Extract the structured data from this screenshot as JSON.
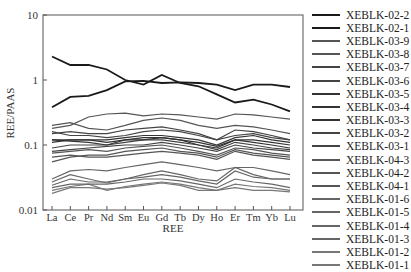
{
  "chart_data": {
    "type": "line",
    "title": "",
    "xlabel": "REE",
    "ylabel": "REE/PAAS",
    "yscale": "log",
    "ylim": [
      0.01,
      10
    ],
    "yticks": [
      "0.01",
      "0.1",
      "1",
      "10"
    ],
    "grid": false,
    "legend_position": "right",
    "categories": [
      "La",
      "Ce",
      "Pr",
      "Nd",
      "Sm",
      "Eu",
      "Gd",
      "Tb",
      "Dy",
      "Ho",
      "Er",
      "Tm",
      "Yb",
      "Lu"
    ],
    "series": [
      {
        "name": "XEBLK-02-2",
        "color": "#1a1a1a",
        "width": 1.8,
        "values": [
          2.3,
          1.7,
          1.7,
          1.45,
          1.0,
          0.85,
          1.2,
          0.9,
          0.8,
          0.6,
          0.45,
          0.5,
          0.42,
          0.33
        ]
      },
      {
        "name": "XEBLK-02-1",
        "color": "#1a1a1a",
        "width": 1.8,
        "values": [
          0.38,
          0.55,
          0.57,
          0.7,
          0.95,
          0.97,
          0.9,
          0.92,
          0.9,
          0.85,
          0.7,
          0.85,
          0.85,
          0.78
        ]
      },
      {
        "name": "XEBLK-03-9",
        "color": "#555",
        "width": 1.2,
        "values": [
          0.18,
          0.2,
          0.27,
          0.3,
          0.31,
          0.28,
          0.3,
          0.29,
          0.27,
          0.25,
          0.3,
          0.29,
          0.27,
          0.25
        ]
      },
      {
        "name": "XEBLK-03-8",
        "color": "#555",
        "width": 1.2,
        "values": [
          0.2,
          0.22,
          0.18,
          0.17,
          0.2,
          0.24,
          0.26,
          0.24,
          0.2,
          0.18,
          0.2,
          0.19,
          0.17,
          0.15
        ]
      },
      {
        "name": "XEBLK-03-7",
        "color": "#444",
        "width": 1.2,
        "values": [
          0.15,
          0.16,
          0.15,
          0.15,
          0.17,
          0.18,
          0.19,
          0.17,
          0.15,
          0.12,
          0.17,
          0.16,
          0.14,
          0.12
        ]
      },
      {
        "name": "XEBLK-03-6",
        "color": "#444",
        "width": 1.2,
        "values": [
          0.16,
          0.14,
          0.14,
          0.13,
          0.14,
          0.16,
          0.17,
          0.16,
          0.14,
          0.12,
          0.14,
          0.15,
          0.13,
          0.12
        ]
      },
      {
        "name": "XEBLK-03-5",
        "color": "#333",
        "width": 1.2,
        "values": [
          0.12,
          0.12,
          0.12,
          0.12,
          0.13,
          0.14,
          0.14,
          0.13,
          0.12,
          0.1,
          0.13,
          0.14,
          0.12,
          0.11
        ]
      },
      {
        "name": "XEBLK-03-4",
        "color": "#333",
        "width": 1.2,
        "values": [
          0.12,
          0.115,
          0.11,
          0.1,
          0.12,
          0.13,
          0.13,
          0.12,
          0.11,
          0.095,
          0.12,
          0.12,
          0.11,
          0.1
        ]
      },
      {
        "name": "XEBLK-03-3",
        "color": "#333",
        "width": 1.2,
        "values": [
          0.11,
          0.12,
          0.12,
          0.11,
          0.12,
          0.12,
          0.13,
          0.12,
          0.1,
          0.09,
          0.12,
          0.11,
          0.1,
          0.09
        ]
      },
      {
        "name": "XEBLK-03-2",
        "color": "#444",
        "width": 1.2,
        "values": [
          0.09,
          0.1,
          0.1,
          0.1,
          0.11,
          0.12,
          0.12,
          0.11,
          0.1,
          0.085,
          0.11,
          0.1,
          0.09,
          0.085
        ]
      },
      {
        "name": "XEBLK-03-1",
        "color": "#444",
        "width": 1.2,
        "values": [
          0.08,
          0.085,
          0.09,
          0.095,
          0.1,
          0.1,
          0.11,
          0.1,
          0.09,
          0.08,
          0.1,
          0.09,
          0.085,
          0.08
        ]
      },
      {
        "name": "XEBLK-04-3",
        "color": "#555",
        "width": 1.2,
        "values": [
          0.075,
          0.08,
          0.085,
          0.08,
          0.09,
          0.095,
          0.1,
          0.09,
          0.08,
          0.07,
          0.09,
          0.085,
          0.075,
          0.07
        ]
      },
      {
        "name": "XEBLK-04-2",
        "color": "#555",
        "width": 1.2,
        "values": [
          0.065,
          0.07,
          0.065,
          0.065,
          0.07,
          0.075,
          0.08,
          0.075,
          0.07,
          0.06,
          0.08,
          0.07,
          0.065,
          0.06
        ]
      },
      {
        "name": "XEBLK-04-1",
        "color": "#555",
        "width": 1.2,
        "values": [
          0.055,
          0.065,
          0.07,
          0.07,
          0.08,
          0.085,
          0.09,
          0.08,
          0.075,
          0.065,
          0.085,
          0.075,
          0.07,
          0.065
        ]
      },
      {
        "name": "XEBLK-01-6",
        "color": "#666",
        "width": 1.2,
        "values": [
          0.03,
          0.04,
          0.042,
          0.04,
          0.045,
          0.05,
          0.055,
          0.05,
          0.045,
          0.04,
          0.045,
          0.045,
          0.04,
          0.035
        ]
      },
      {
        "name": "XEBLK-01-5",
        "color": "#666",
        "width": 1.2,
        "values": [
          0.027,
          0.035,
          0.03,
          0.026,
          0.03,
          0.035,
          0.04,
          0.035,
          0.03,
          0.028,
          0.045,
          0.035,
          0.03,
          0.03
        ]
      },
      {
        "name": "XEBLK-01-4",
        "color": "#666",
        "width": 1.2,
        "values": [
          0.024,
          0.03,
          0.027,
          0.027,
          0.03,
          0.032,
          0.035,
          0.032,
          0.028,
          0.025,
          0.04,
          0.032,
          0.03,
          0.03
        ]
      },
      {
        "name": "XEBLK-01-3",
        "color": "#666",
        "width": 1.2,
        "values": [
          0.022,
          0.025,
          0.025,
          0.025,
          0.027,
          0.03,
          0.03,
          0.028,
          0.025,
          0.022,
          0.03,
          0.027,
          0.025,
          0.022
        ]
      },
      {
        "name": "XEBLK-01-2",
        "color": "#777",
        "width": 1.2,
        "values": [
          0.02,
          0.023,
          0.025,
          0.02,
          0.023,
          0.025,
          0.027,
          0.025,
          0.022,
          0.02,
          0.025,
          0.023,
          0.022,
          0.02
        ]
      },
      {
        "name": "XEBLK-01-1",
        "color": "#777",
        "width": 1.2,
        "values": [
          0.018,
          0.022,
          0.022,
          0.021,
          0.022,
          0.024,
          0.026,
          0.024,
          0.02,
          0.02,
          0.022,
          0.02,
          0.02,
          0.019
        ]
      }
    ]
  }
}
